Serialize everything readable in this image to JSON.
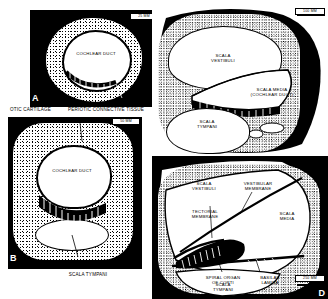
{
  "figure": {
    "panel_count": 4,
    "ink_color": "#000000",
    "paper_color": "#ffffff"
  },
  "panels": [
    {
      "id": "A",
      "letter": "A",
      "scale": "25 MM",
      "labels": [
        {
          "name": "cochlear-duct",
          "text": "COCHLEAR DUCT"
        }
      ]
    },
    {
      "id": "B",
      "letter": "B",
      "scale": "50 MM",
      "labels": [
        {
          "name": "cochlear-duct",
          "text": "COCHLEAR DUCT"
        },
        {
          "name": "scala-tympani",
          "text": "SCALA TYMPANI"
        }
      ]
    },
    {
      "id": "C",
      "letter": "C",
      "scale": "100 MM",
      "labels": [
        {
          "name": "scala-vestibuli",
          "text": "SCALA\nVESTIBULI"
        },
        {
          "name": "scala-media",
          "text": "SCALA MEDIA"
        },
        {
          "name": "cochlear-duct",
          "text": "(COCHLEAR DUCT)"
        },
        {
          "name": "scala-tympani",
          "text": "SCALA\nTYMPANI"
        }
      ]
    },
    {
      "id": "D",
      "letter": "D",
      "scale": "250 MM",
      "labels": [
        {
          "name": "scala-vestibuli",
          "text": "SCALA\nVESTIBULI"
        },
        {
          "name": "vestibular-membrane",
          "text": "VESTIBULAR\nMEMBRANE"
        },
        {
          "name": "tectorial-membrane",
          "text": "TECTORIAL\nMEMBRANE"
        },
        {
          "name": "scala-media",
          "text": "SCALA\nMEDIA"
        },
        {
          "name": "spiral-organ-of-corti",
          "text": "SPIRAL ORGAN\nOF CORTI"
        },
        {
          "name": "basilar-lamina",
          "text": "BASILAR\nLAMINA"
        },
        {
          "name": "scala-tympani",
          "text": "SCALA\nTYMPANI"
        }
      ]
    }
  ],
  "shared_labels": {
    "otic_cartilage": "OTIC CARTILAGE",
    "periotic_connective_tissue": "PERIOTIC CONNECTIVE TISSUE"
  },
  "panelA": {
    "letter": "A",
    "scale": "25 MM",
    "cochlear_duct": "COCHLEAR DUCT"
  },
  "panelB": {
    "letter": "B",
    "scale": "50 MM",
    "cochlear_duct": "COCHLEAR DUCT",
    "scala_tympani": "SCALA TYMPANI"
  },
  "panelC": {
    "letter": "C",
    "scale": "100 MM",
    "scala_vestibuli_1": "SCALA",
    "scala_vestibuli_2": "VESTIBULI",
    "scala_media": "SCALA MEDIA",
    "cochlear_duct": "(COCHLEAR DUCT)",
    "scala_tympani_1": "SCALA",
    "scala_tympani_2": "TYMPANI"
  },
  "panelD": {
    "letter": "D",
    "scale": "250 MM",
    "scala_vestibuli_1": "SCALA",
    "scala_vestibuli_2": "VESTIBULI",
    "vestibular_membrane_1": "VESTIBULAR",
    "vestibular_membrane_2": "MEMBRANE",
    "tectorial_membrane_1": "TECTORIAL",
    "tectorial_membrane_2": "MEMBRANE",
    "scala_media_1": "SCALA",
    "scala_media_2": "MEDIA",
    "spiral_organ_1": "SPIRAL ORGAN",
    "spiral_organ_2": "OF CORTI",
    "basilar_lamina_1": "BASILAR",
    "basilar_lamina_2": "LAMINA",
    "scala_tympani_1": "SCALA",
    "scala_tympani_2": "TYMPANI"
  }
}
